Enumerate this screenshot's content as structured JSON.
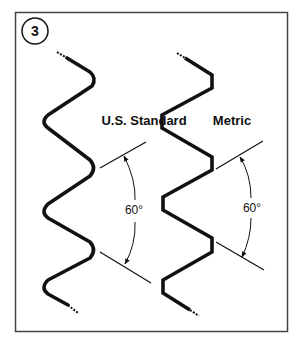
{
  "figure": {
    "step_number": "3",
    "colors": {
      "stroke": "#111111",
      "frame": "#444444",
      "background": "#ffffff"
    },
    "profiles": [
      {
        "name": "us-standard",
        "label": "U.S. Standard",
        "angle_label": "60°",
        "crest_style": "rounded"
      },
      {
        "name": "metric",
        "label": "Metric",
        "angle_label": "60°",
        "crest_style": "flat"
      }
    ]
  }
}
